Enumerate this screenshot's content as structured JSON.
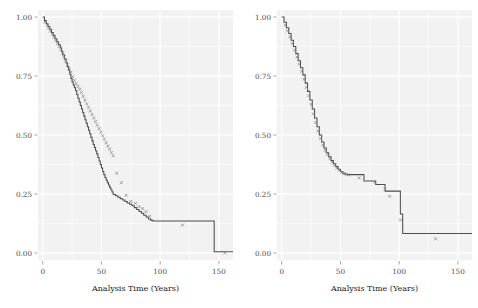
{
  "figure": {
    "background": "#ffffff",
    "panel_background": "#f2f2f2",
    "gridline_color": "#ffffff",
    "curve_color": "#4d4d4d",
    "censor_color": "#808080",
    "tick_color": "#808080",
    "text_color": "#4d4d4d"
  },
  "chart_data": [
    {
      "type": "line",
      "title": "",
      "subtitle": "",
      "panel": "left",
      "xlabel": "Analysis Time (Years)",
      "ylabel": "",
      "xlim": [
        -4,
        162
      ],
      "ylim": [
        -0.03,
        1.03
      ],
      "xticks": [
        0,
        50,
        100,
        150
      ],
      "xtick_labels": [
        "0",
        "50",
        "100",
        "150"
      ],
      "yticks": [
        0.0,
        0.25,
        0.5,
        0.75,
        1.0
      ],
      "ytick_labels": [
        "0.00",
        "0.25",
        "0.50",
        "0.75",
        "1.00"
      ],
      "grid": true,
      "legend": "none",
      "series": [
        {
          "name": "Kaplan-Meier survival estimate",
          "style": "step",
          "x": [
            0,
            1.5,
            3,
            4.5,
            6,
            7.5,
            9,
            10.5,
            12,
            13.5,
            15,
            16,
            17,
            18.5,
            20,
            21,
            22,
            23,
            24,
            25,
            26,
            27,
            28,
            29,
            30,
            31,
            32,
            33,
            34,
            35,
            36,
            37,
            38,
            39,
            40,
            41,
            42,
            43,
            44,
            45,
            46,
            47,
            48,
            49,
            50,
            51,
            52,
            53,
            54,
            55,
            56,
            57,
            58,
            59,
            60,
            62,
            64,
            66,
            68,
            70,
            72,
            74,
            76,
            78,
            80,
            82,
            84,
            86,
            88,
            90,
            92,
            94,
            145,
            146,
            160
          ],
          "y": [
            1.0,
            0.985,
            0.972,
            0.96,
            0.948,
            0.935,
            0.922,
            0.908,
            0.895,
            0.883,
            0.87,
            0.855,
            0.84,
            0.822,
            0.805,
            0.79,
            0.775,
            0.758,
            0.74,
            0.725,
            0.712,
            0.7,
            0.688,
            0.672,
            0.656,
            0.64,
            0.625,
            0.61,
            0.595,
            0.58,
            0.565,
            0.55,
            0.535,
            0.52,
            0.505,
            0.49,
            0.475,
            0.46,
            0.447,
            0.433,
            0.42,
            0.405,
            0.39,
            0.375,
            0.36,
            0.345,
            0.332,
            0.32,
            0.308,
            0.298,
            0.288,
            0.278,
            0.268,
            0.258,
            0.248,
            0.242,
            0.236,
            0.23,
            0.224,
            0.218,
            0.212,
            0.206,
            0.2,
            0.192,
            0.184,
            0.176,
            0.168,
            0.16,
            0.152,
            0.144,
            0.138,
            0.135,
            0.135,
            0.005,
            0.005
          ]
        }
      ],
      "censor_marks": {
        "name": "censored observations",
        "x": [
          2,
          4,
          5,
          6.5,
          8,
          9.5,
          11,
          12.5,
          14,
          15.5,
          17,
          18,
          19.5,
          21,
          22.5,
          24,
          25.5,
          27,
          28.5,
          30,
          31.5,
          33,
          34.5,
          36,
          37.5,
          39,
          40.5,
          42,
          43.5,
          45,
          46.5,
          48,
          49.5,
          51,
          52.5,
          54,
          55.5,
          57,
          58.5,
          60,
          63,
          67,
          71,
          75,
          79,
          82,
          85,
          88,
          91,
          119,
          155
        ],
        "y": [
          0.978,
          0.966,
          0.954,
          0.941,
          0.929,
          0.915,
          0.901,
          0.888,
          0.876,
          0.862,
          0.847,
          0.832,
          0.813,
          0.797,
          0.782,
          0.766,
          0.748,
          0.732,
          0.718,
          0.706,
          0.694,
          0.68,
          0.664,
          0.648,
          0.632,
          0.617,
          0.602,
          0.587,
          0.572,
          0.557,
          0.542,
          0.527,
          0.512,
          0.497,
          0.482,
          0.467,
          0.453,
          0.44,
          0.426,
          0.412,
          0.338,
          0.298,
          0.245,
          0.218,
          0.21,
          0.196,
          0.188,
          0.175,
          0.155,
          0.118,
          0.0
        ]
      }
    },
    {
      "type": "line",
      "title": "",
      "subtitle": "",
      "panel": "right",
      "xlabel": "Analysis Time (Years)",
      "ylabel": "",
      "xlim": [
        -4,
        162
      ],
      "ylim": [
        -0.03,
        1.03
      ],
      "xticks": [
        0,
        50,
        100,
        150
      ],
      "xtick_labels": [
        "0",
        "50",
        "100",
        "150"
      ],
      "yticks": [
        0.0,
        0.25,
        0.5,
        0.75,
        1.0
      ],
      "ytick_labels": [
        "0.00",
        "0.25",
        "0.50",
        "0.75",
        "1.00"
      ],
      "grid": true,
      "legend": "none",
      "series": [
        {
          "name": "Kaplan-Meier survival estimate",
          "style": "step",
          "x": [
            0,
            2,
            4,
            6,
            8,
            10,
            12,
            14,
            16,
            18,
            20,
            22,
            24,
            26,
            28,
            30,
            32,
            34,
            36,
            38,
            40,
            42,
            44,
            46,
            48,
            50,
            52,
            54,
            56,
            58,
            62,
            70,
            72,
            80,
            82,
            88,
            90,
            95,
            100,
            101,
            102,
            103,
            104,
            160
          ],
          "y": [
            1.0,
            0.978,
            0.955,
            0.93,
            0.902,
            0.875,
            0.845,
            0.815,
            0.785,
            0.755,
            0.72,
            0.685,
            0.648,
            0.61,
            0.572,
            0.535,
            0.5,
            0.47,
            0.445,
            0.425,
            0.408,
            0.392,
            0.378,
            0.366,
            0.355,
            0.345,
            0.338,
            0.334,
            0.332,
            0.332,
            0.332,
            0.305,
            0.305,
            0.29,
            0.29,
            0.262,
            0.262,
            0.262,
            0.262,
            0.165,
            0.165,
            0.082,
            0.082,
            0.082
          ]
        }
      ],
      "censor_marks": {
        "name": "censored observations",
        "x": [
          3,
          5,
          7,
          9,
          11,
          13,
          15,
          17,
          19,
          21,
          23,
          25,
          27,
          29,
          31,
          33,
          35,
          37,
          39,
          41,
          43,
          45,
          47,
          49,
          51,
          53,
          55,
          57,
          66,
          79,
          88,
          92,
          101,
          131
        ],
        "y": [
          0.966,
          0.942,
          0.916,
          0.888,
          0.86,
          0.83,
          0.8,
          0.77,
          0.737,
          0.702,
          0.666,
          0.63,
          0.59,
          0.553,
          0.517,
          0.485,
          0.457,
          0.435,
          0.416,
          0.4,
          0.385,
          0.372,
          0.36,
          0.35,
          0.341,
          0.336,
          0.333,
          0.331,
          0.318,
          0.3,
          0.27,
          0.24,
          0.14,
          0.06
        ]
      }
    }
  ]
}
